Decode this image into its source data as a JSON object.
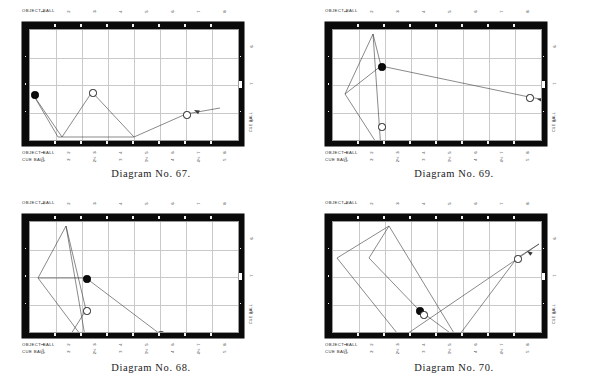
{
  "document": {
    "kind": "billiards-diagram-plate",
    "panel_count": 4
  },
  "labels": {
    "object_ball": "OBJECT BALL",
    "cue_ball": "CUE BALL",
    "side_title": "CUE BALL"
  },
  "scales": {
    "object_ball_top": [
      "1",
      "2",
      "3",
      "4",
      "5",
      "6",
      "7",
      "8"
    ],
    "object_ball_bottom": [
      "1",
      "2",
      "3",
      "4",
      "5",
      "6",
      "7",
      "8"
    ],
    "cue_ball_bottom": [
      "1½",
      "2",
      "2½",
      "3",
      "3½",
      "4",
      "4½",
      "5"
    ],
    "cue_ball_side": [
      "6",
      "7",
      "8"
    ]
  },
  "colors": {
    "rail": "#0a0a0a",
    "felt": "#ffffff",
    "grid": "#c9c9c9",
    "diamond": "#f2f2f2",
    "object_ball": "#0d0d0d",
    "cue_ball": "#ffffff",
    "path": "#3a3a3a",
    "caption": "#1c1c1c"
  },
  "panels": [
    {
      "id": "diagram-67",
      "caption": "Diagram No. 67.",
      "balls": [
        {
          "type": "object",
          "x": 4,
          "y": 64,
          "name": "object-ball"
        },
        {
          "type": "cue",
          "x": 62,
          "y": 62,
          "name": "cue-ball-secondary"
        },
        {
          "type": "cue",
          "x": 156,
          "y": 84,
          "name": "cue-ball"
        }
      ],
      "paths": [
        {
          "name": "shot-path",
          "points": "190,78 156,84 104,107 62,62"
        },
        {
          "name": "rebound-path",
          "points": "4,66 32,107 62,62"
        },
        {
          "name": "carom-path",
          "points": "4,66 28,107 104,107"
        }
      ],
      "arrow": {
        "x": 164,
        "y": 80,
        "angle": 205
      }
    },
    {
      "id": "diagram-69",
      "caption": "Diagram No. 69.",
      "balls": [
        {
          "type": "object",
          "x": 48,
          "y": 36,
          "name": "object-ball"
        },
        {
          "type": "cue",
          "x": 48,
          "y": 96,
          "name": "cue-ball-secondary"
        },
        {
          "type": "cue",
          "x": 196,
          "y": 67,
          "name": "cue-ball"
        }
      ],
      "paths": [
        {
          "name": "shot-path",
          "points": "224,72 196,67 48,36"
        },
        {
          "name": "rebound-path",
          "points": "48,36 12,64 48,120"
        },
        {
          "name": "carom-path",
          "points": "48,36 40,4 12,64"
        },
        {
          "name": "return-path",
          "points": "40,4 48,120"
        }
      ],
      "arrow": {
        "x": 204,
        "y": 69,
        "angle": 192
      }
    },
    {
      "id": "diagram-68",
      "caption": "Diagram No. 68.",
      "balls": [
        {
          "type": "object",
          "x": 56,
          "y": 56,
          "name": "object-ball"
        },
        {
          "type": "cue",
          "x": 56,
          "y": 88,
          "name": "cue-ball-secondary"
        },
        {
          "type": "cue",
          "x": 130,
          "y": 112,
          "name": "cue-ball"
        }
      ],
      "paths": [
        {
          "name": "shot-path",
          "points": "146,122 130,112 56,56"
        },
        {
          "name": "rebound-path",
          "points": "56,56 8,56 36,4"
        },
        {
          "name": "carom-path",
          "points": "36,4 56,120 8,56"
        },
        {
          "name": "spine-path",
          "points": "36,4 56,88 36,120"
        }
      ],
      "arrow": {
        "x": 140,
        "y": 118,
        "angle": 32
      }
    },
    {
      "id": "diagram-70",
      "caption": "Diagram No. 70.",
      "balls": [
        {
          "type": "object",
          "x": 86,
          "y": 88,
          "name": "object-ball"
        },
        {
          "type": "cue",
          "x": 90,
          "y": 92,
          "name": "cue-ball-secondary"
        },
        {
          "type": "cue",
          "x": 184,
          "y": 36,
          "name": "cue-ball"
        }
      ],
      "paths": [
        {
          "name": "shot-path",
          "points": "206,22 184,36 124,116 86,88"
        },
        {
          "name": "rebound-path",
          "points": "86,88 36,36 56,4 124,116"
        },
        {
          "name": "carom-path",
          "points": "56,4 4,36 68,116 206,22"
        }
      ],
      "arrow": {
        "x": 194,
        "y": 29,
        "angle": 215
      }
    }
  ]
}
